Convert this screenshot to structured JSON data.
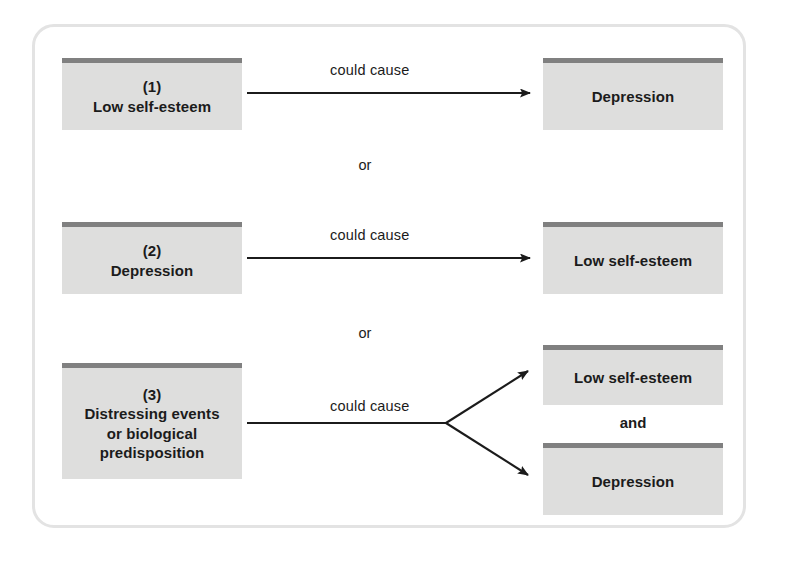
{
  "figure": {
    "frame_color": "#e3e3e3",
    "box_fill": "#dededd",
    "box_top_bar": "#808080",
    "arrow_color": "#1b1b1b"
  },
  "rows": [
    {
      "id": "row-1",
      "cause": {
        "number": "(1)",
        "label": "Low self-esteem"
      },
      "relation": "could cause",
      "effects": [
        {
          "label": "Depression"
        }
      ],
      "separator_below": "or"
    },
    {
      "id": "row-2",
      "cause": {
        "number": "(2)",
        "label": "Depression"
      },
      "relation": "could cause",
      "effects": [
        {
          "label": "Low self-esteem"
        }
      ],
      "separator_below": "or"
    },
    {
      "id": "row-3",
      "cause": {
        "number": "(3)",
        "label": "Distressing events or biological predisposition",
        "lines": [
          "Distressing events",
          "or biological",
          "predisposition"
        ]
      },
      "relation": "could cause",
      "effects": [
        {
          "label": "Low self-esteem"
        },
        {
          "label": "Depression"
        }
      ],
      "effect_joiner": "and",
      "separator_below": ""
    }
  ],
  "icons": {
    "arrow": "arrow-right-icon",
    "fork": "fork-arrow-icon"
  }
}
